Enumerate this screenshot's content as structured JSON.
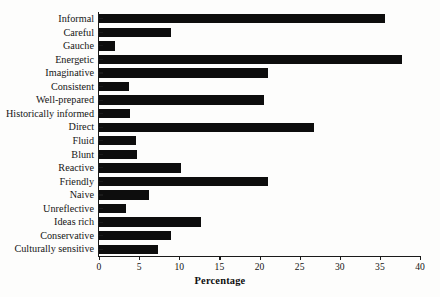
{
  "chart_data": {
    "type": "bar",
    "orientation": "horizontal",
    "title": "",
    "xlabel": "Percentage",
    "ylabel": "",
    "xlim": [
      0,
      40
    ],
    "xticks": [
      0,
      5,
      10,
      15,
      20,
      25,
      30,
      35,
      40
    ],
    "xtick_labels": [
      "0",
      "5",
      "10",
      "15",
      "20",
      "25",
      "30",
      "35",
      "40"
    ],
    "grid": false,
    "legend": false,
    "bar_color": "#0d0d0d",
    "categories": [
      "Informal",
      "Careful",
      "Gauche",
      "Energetic",
      "Imaginative",
      "Consistent",
      "Well-prepared",
      "Historically informed",
      "Direct",
      "Fluid",
      "Blunt",
      "Reactive",
      "Friendly",
      "Naive",
      "Unreflective",
      "Ideas rich",
      "Conservative",
      "Culturally sensitive"
    ],
    "values": [
      35.7,
      9.0,
      2.0,
      37.8,
      21.0,
      3.8,
      20.6,
      3.9,
      26.8,
      4.6,
      4.7,
      10.2,
      21.1,
      6.2,
      3.4,
      12.7,
      9.0,
      7.3
    ]
  }
}
